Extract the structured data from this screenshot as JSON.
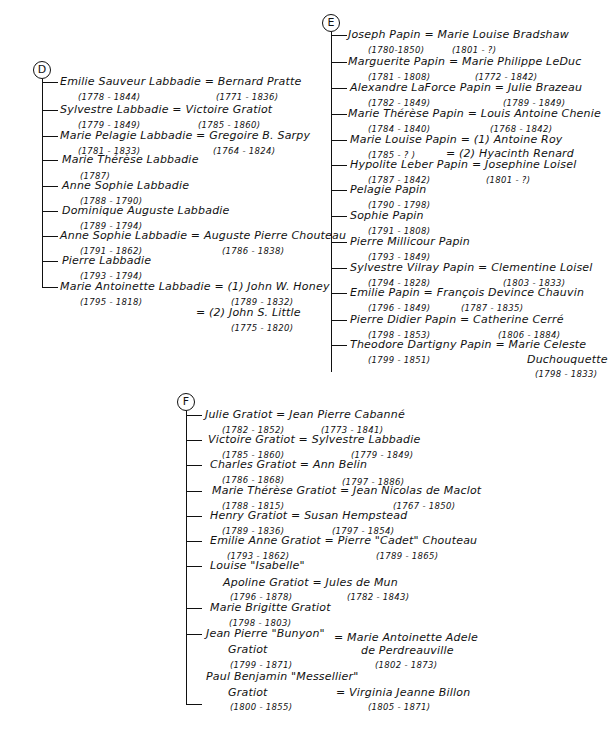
{
  "families": {
    "D": {
      "label": "D",
      "entries": [
        {
          "name": "Emilie Sauveur Labbadie = Bernard Pratte",
          "d1": "(1778 - 1844)",
          "d2": "(1771 - 1836)"
        },
        {
          "name": "Sylvestre Labbadie = Victoire Gratiot",
          "d1": "(1779 - 1849)",
          "d2": "(1785 - 1860)"
        },
        {
          "name": "Marie Pelagie Labbadie = Gregoire B. Sarpy",
          "d1": "(1781 - 1833)",
          "d2": "(1764 - 1824)"
        },
        {
          "name": "Marie Thérèse Labbadie",
          "d1": "(1787)"
        },
        {
          "name": "Anne Sophie Labbadie",
          "d1": "(1788 - 1790)"
        },
        {
          "name": "Dominique Auguste Labbadie",
          "d1": "(1789 - 1794)"
        },
        {
          "name": "Anne Sophie Labbadie = Auguste Pierre Chouteau",
          "d1": "(1791 - 1862)",
          "d2": "(1786 - 1838)"
        },
        {
          "name": "Pierre Labbadie",
          "d1": "(1793 - 1794)"
        },
        {
          "name": "Marie Antoinette Labbadie = (1) John W. Honey",
          "d1": "(1795 - 1818)",
          "d2": "(1789 - 1832)",
          "name2": "= (2) John S. Little",
          "d3": "(1775 - 1820)"
        }
      ]
    },
    "E": {
      "label": "E",
      "entries": [
        {
          "name": "Joseph Papin = Marie Louise Bradshaw",
          "d1": "(1780-1850)",
          "d2": "(1801 - ?)"
        },
        {
          "name": "Marguerite Papin = Marie Philippe LeDuc",
          "d1": "(1781 - 1808)",
          "d2": "(1772 - 1842)"
        },
        {
          "name": "Alexandre LaForce Papin = Julie Brazeau",
          "d1": "(1782 - 1849)",
          "d2": "(1789 - 1849)"
        },
        {
          "name": "Marie Thérèse Papin = Louis Antoine Chenie",
          "d1": "(1784 - 1840)",
          "d2": "(1768 - 1842)"
        },
        {
          "name": "Marie Louise Papin = (1) Antoine Roy",
          "d1": "(1785 - ? )",
          "d2": "= (2) Hyacinth Renard"
        },
        {
          "name": "Hypolite Leber Papin = Josephine Loisel",
          "d1": "(1787 - 1842)",
          "d2": "(1801 - ?)"
        },
        {
          "name": "Pelagie Papin",
          "d1": "(1790 - 1798)"
        },
        {
          "name": "Sophie Papin",
          "d1": "(1791 - 1808)"
        },
        {
          "name": "Pierre Millicour Papin",
          "d1": "(1793 - 1849)"
        },
        {
          "name": "Sylvestre Vilray Papin = Clementine Loisel",
          "d1": "(1794 - 1828)",
          "d2": "(1803 - 1833)"
        },
        {
          "name": "Emilie Papin = François Devince Chauvin",
          "d1": "(1796 - 1849)",
          "d2": "(1787 - 1835)"
        },
        {
          "name": "Pierre Didier Papin = Catherine Cerré",
          "d1": "(1798 - 1853)",
          "d2": "(1806 - 1884)"
        },
        {
          "name": "Theodore Dartigny Papin = Marie Celeste",
          "d1": "(1799 - 1851)",
          "name2": "Duchouquette",
          "d3": "(1798 - 1833)"
        }
      ]
    },
    "F": {
      "label": "F",
      "entries": [
        {
          "name": "Julie Gratiot = Jean Pierre Cabanné",
          "d1": "(1782 - 1852)",
          "d2": "(1773 - 1841)"
        },
        {
          "name": "Victoire Gratiot = Sylvestre Labbadie",
          "d1": "(1785 - 1860)",
          "d2": "(1779 - 1849)"
        },
        {
          "name": "Charles Gratiot = Ann Belin",
          "d1": "(1786 - 1868)",
          "d2": "(1797 - 1886)"
        },
        {
          "name": "Marie Thérèse Gratiot = Jean Nicolas de Maclot",
          "d1": "(1788 - 1815)",
          "d2": "(1767 - 1850)"
        },
        {
          "name": "Henry Gratiot = Susan Hempstead",
          "d1": "(1789 - 1836)",
          "d2": "(1797 - 1854)"
        },
        {
          "name": "Emilie Anne Gratiot = Pierre \"Cadet\" Chouteau",
          "d1": "(1793 - 1862)",
          "d2": "(1789 - 1865)"
        },
        {
          "name": "Louise \"Isabelle\"",
          "name2": "Apoline Gratiot = Jules de Mun",
          "d1": "(1796 - 1878)",
          "d2": "(1782 - 1843)"
        },
        {
          "name": "Marie Brigitte Gratiot",
          "d1": "(1798 - 1803)"
        },
        {
          "name": "Jean Pierre \"Bunyon\"",
          "name2": "Gratiot",
          "spouse": "= Marie Antoinette Adele",
          "spouse2": "de Perdreauville",
          "d1": "(1799 - 1871)",
          "d2": "(1802 - 1873)"
        },
        {
          "name": "Paul Benjamin \"Messellier\"",
          "name2": "Gratiot",
          "spouse": "= Virginia Jeanne Billon",
          "d1": "(1800 - 1855)",
          "d2": "(1805 - 1871)"
        }
      ]
    }
  }
}
